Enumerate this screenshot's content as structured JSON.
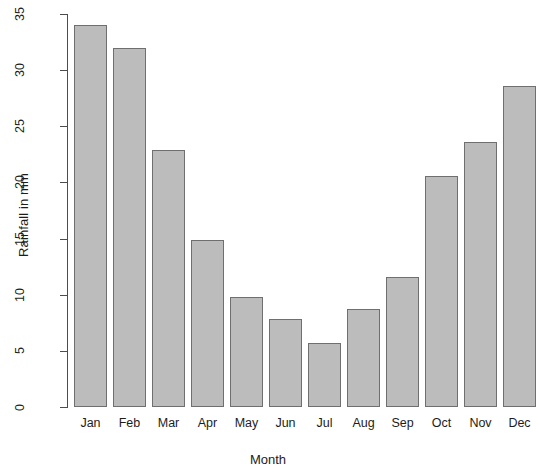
{
  "chart_data": {
    "type": "bar",
    "title": "",
    "xlabel": "Month",
    "ylabel": "Rainfall in mm",
    "categories": [
      "Jan",
      "Feb",
      "Mar",
      "Apr",
      "May",
      "Jun",
      "Jul",
      "Aug",
      "Sep",
      "Oct",
      "Nov",
      "Dec"
    ],
    "values": [
      34.0,
      32.0,
      22.9,
      14.9,
      9.8,
      7.8,
      5.7,
      8.7,
      11.6,
      20.6,
      23.6,
      28.6
    ],
    "ylim": [
      0,
      35
    ],
    "ytick_labels": [
      "0",
      "5",
      "10",
      "15",
      "20",
      "25",
      "30",
      "35"
    ],
    "ytick_values": [
      0,
      5,
      10,
      15,
      20,
      25,
      30,
      35
    ],
    "grid": false,
    "legend": false,
    "legend_position": "none",
    "bar_fill_color": "#bcbcbc",
    "bar_border_color": "#6f6f6f",
    "axis_color": "#4d4d4d",
    "background_color": "#ffffff"
  }
}
